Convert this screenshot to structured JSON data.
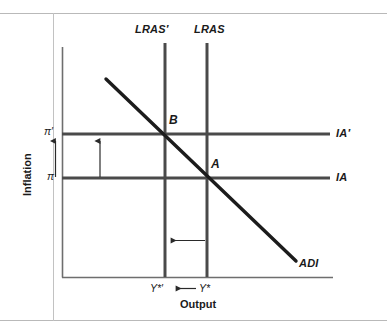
{
  "figure": {
    "type": "economics-diagram",
    "axes": {
      "x_title": "Output",
      "y_title": "Inflation"
    },
    "y_ticks": [
      {
        "id": "pi-prime",
        "label": "π′",
        "y": 134
      },
      {
        "id": "pi",
        "label": "π",
        "y": 178
      }
    ],
    "x_ticks": [
      {
        "id": "y-star-prime",
        "label": "Y*′",
        "x": 165
      },
      {
        "id": "y-star",
        "label": "Y*",
        "x": 207
      }
    ],
    "curves": [
      {
        "id": "lras-prime",
        "label": "LRAS′",
        "kind": "vertical",
        "x": 165
      },
      {
        "id": "lras",
        "label": "LRAS",
        "kind": "vertical",
        "x": 207
      },
      {
        "id": "ia-prime",
        "label": "IA′",
        "kind": "horizontal",
        "y": 134
      },
      {
        "id": "ia",
        "label": "IA",
        "kind": "horizontal",
        "y": 178
      },
      {
        "id": "adi",
        "label": "ADI",
        "kind": "downward-sloping"
      }
    ],
    "points": [
      {
        "id": "point-b",
        "label": "B",
        "x": 165,
        "y": 134
      },
      {
        "id": "point-a",
        "label": "A",
        "x": 207,
        "y": 178
      }
    ],
    "arrows": [
      {
        "id": "inflation-rise-outer",
        "direction": "up",
        "location": "y-axis"
      },
      {
        "id": "inflation-rise-inner",
        "direction": "up",
        "location": "plot-area"
      },
      {
        "id": "output-fall",
        "direction": "left",
        "location": "plot-area"
      },
      {
        "id": "output-fall-axis",
        "direction": "left",
        "location": "x-axis"
      }
    ],
    "colors": {
      "curve": "#4a4a4a",
      "adi": "#1c1c1c",
      "axis": "#6e6e6e",
      "rule": "#b9b9b9",
      "text": "#1a1a1a",
      "background": "#ffffff"
    }
  }
}
